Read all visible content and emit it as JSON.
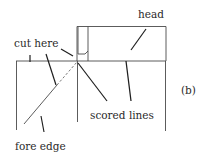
{
  "diagram": {
    "labels": {
      "head": "head",
      "cut_here": "cut here",
      "scored_lines": "scored lines",
      "fore_edge": "fore edge",
      "panel": "(b)"
    },
    "colors": {
      "line": "#4a4a4a",
      "leader": "#1e1e1e",
      "text": "#2a2a2a",
      "background": "#ffffff"
    }
  }
}
